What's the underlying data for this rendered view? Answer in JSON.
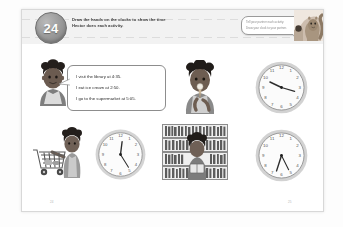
{
  "worksheet": {
    "unit_number": "24",
    "instructions": [
      "Draw the hands on the clocks to show the time",
      "Hector does each activity."
    ],
    "hint_bubble": {
      "lines": [
        "Tell your partner each activity.",
        "Draw your clock to your partner."
      ]
    },
    "mascot": "squirrel-mascot",
    "page_marker_left": "24",
    "page_marker_right": "25"
  },
  "speech_bubble": {
    "speaker": "Hector",
    "lines": [
      "I visit the library at 4:35.",
      "I eat ice cream at 2:50.",
      "I go to the supermarket at 5:05."
    ]
  },
  "figures": [
    {
      "id": "hector-portrait",
      "label": "boy-speaking",
      "row": 1,
      "col": 1
    },
    {
      "id": "ice-cream-boy",
      "label": "boy-eating-ice-cream",
      "row": 1,
      "col": 2
    },
    {
      "id": "supermarket-cart",
      "label": "shopping-cart-scene",
      "row": 2,
      "col": 1
    },
    {
      "id": "library-shelves",
      "label": "library-scene",
      "row": 2,
      "col": 2
    }
  ],
  "clocks": [
    {
      "id": "clock-top-right",
      "position": "row1-col3",
      "numerals": [
        "12",
        "1",
        "2",
        "3",
        "4",
        "5",
        "6",
        "7",
        "8",
        "9",
        "10",
        "11"
      ],
      "hour_angle": 295,
      "minute_angle": 60,
      "display_time": "10:10"
    },
    {
      "id": "clock-bottom-left",
      "position": "row2-col1",
      "numerals": [
        "12",
        "1",
        "2",
        "3",
        "4",
        "5",
        "6",
        "7",
        "8",
        "9",
        "10",
        "11"
      ],
      "hour_angle": 10,
      "minute_angle": 140,
      "display_time": "12:25"
    },
    {
      "id": "clock-bottom-right",
      "position": "row2-col3",
      "numerals": [
        "12",
        "1",
        "2",
        "3",
        "4",
        "5",
        "6",
        "7",
        "8",
        "9",
        "10",
        "11"
      ],
      "hour_angle": 200,
      "minute_angle": 160,
      "display_time": "6:30"
    }
  ],
  "colors": {
    "page_bg": "#ffffff",
    "header_bg": "#f2f2f2",
    "badge_fill": "#8e8e8e",
    "border": "#d8d8d8",
    "text": "#3a3a3a",
    "muted": "#8c8c8c"
  }
}
